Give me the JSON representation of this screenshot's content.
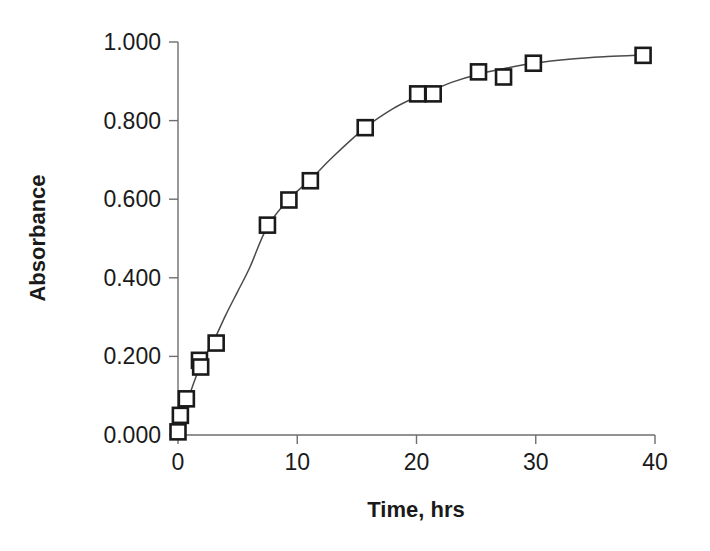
{
  "chart_data": {
    "type": "scatter",
    "title": "",
    "subtitle": "",
    "xlabel": "Time, hrs",
    "ylabel": "Absorbance",
    "xlim": [
      0,
      40
    ],
    "ylim": [
      0.0,
      1.0
    ],
    "xticks": [
      0,
      10,
      20,
      30,
      40
    ],
    "xtick_labels": [
      "0",
      "10",
      "20",
      "30",
      "40"
    ],
    "yticks": [
      0.0,
      0.2,
      0.4,
      0.6,
      0.8,
      1.0
    ],
    "ytick_labels": [
      "0.000",
      "0.200",
      "0.400",
      "0.600",
      "0.800",
      "1.000"
    ],
    "grid": false,
    "legend": null,
    "legend_position": "none",
    "marker_style": "open-square",
    "series": [
      {
        "name": "Absorbance",
        "x": [
          0.0,
          0.2,
          0.7,
          1.8,
          1.9,
          3.2,
          7.5,
          9.3,
          11.1,
          15.7,
          20.1,
          21.4,
          25.2,
          27.3,
          29.8,
          39.0
        ],
        "y": [
          0.008,
          0.05,
          0.092,
          0.19,
          0.173,
          0.234,
          0.534,
          0.598,
          0.647,
          0.782,
          0.868,
          0.868,
          0.924,
          0.911,
          0.946,
          0.966
        ]
      }
    ],
    "fit_curve": {
      "name": "smoothed fit",
      "x": [
        0.0,
        1.0,
        2.0,
        3.0,
        4.0,
        5.0,
        6.0,
        7.5,
        9.3,
        11.1,
        13.0,
        15.7,
        18.0,
        20.1,
        21.4,
        23.0,
        25.2,
        27.3,
        29.8,
        33.0,
        36.0,
        39.0
      ],
      "y": [
        0.01,
        0.105,
        0.185,
        0.24,
        0.305,
        0.365,
        0.425,
        0.53,
        0.6,
        0.65,
        0.708,
        0.782,
        0.83,
        0.862,
        0.878,
        0.898,
        0.918,
        0.932,
        0.946,
        0.957,
        0.963,
        0.967
      ]
    }
  },
  "axes": {
    "x_axis_name": "time-axis",
    "y_axis_name": "absorbance-axis"
  }
}
